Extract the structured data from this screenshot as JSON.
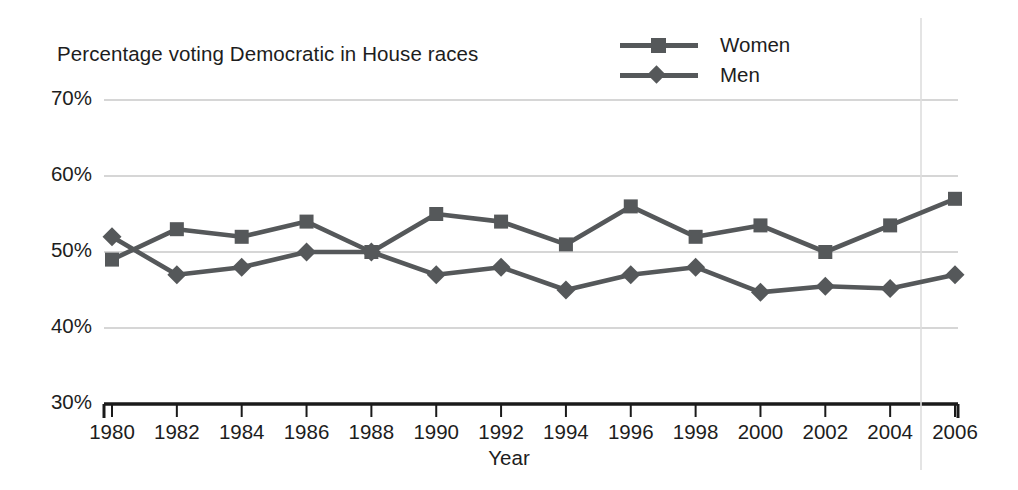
{
  "chart_data": {
    "type": "line",
    "title": "Percentage voting Democratic in House races",
    "xlabel": "Year",
    "ylabel": "",
    "categories": [
      1980,
      1982,
      1984,
      1986,
      1988,
      1990,
      1992,
      1994,
      1996,
      1998,
      2000,
      2002,
      2004,
      2006
    ],
    "x": [
      1980,
      1982,
      1984,
      1986,
      1988,
      1990,
      1992,
      1994,
      1996,
      1998,
      2000,
      2002,
      2004,
      2006
    ],
    "series": [
      {
        "name": "Women",
        "marker": "square",
        "color": "#55585a",
        "values": [
          49,
          53,
          52,
          54,
          50,
          55,
          54,
          51,
          56,
          52,
          53.5,
          50,
          53.5,
          57
        ]
      },
      {
        "name": "Men",
        "marker": "diamond",
        "color": "#55585a",
        "values": [
          52,
          47,
          48,
          50,
          50,
          47,
          48,
          45,
          47,
          48,
          44.7,
          45.5,
          45.2,
          47
        ]
      }
    ],
    "xlim": [
      1979,
      2007
    ],
    "ylim": [
      30,
      70
    ],
    "ytick_labels": [
      "70%",
      "60%",
      "50%",
      "40%",
      "30%"
    ],
    "ytick_values": [
      70,
      60,
      50,
      40,
      30
    ],
    "xtick_labels": [
      "1980",
      "1982",
      "1984",
      "1986",
      "1988",
      "1990",
      "1992",
      "1994",
      "1996",
      "1998",
      "2000",
      "2002",
      "2004",
      "2006"
    ],
    "grid": true,
    "grid_color": "#c9c9c9",
    "legend_position": "top-right",
    "legend": [
      "Women",
      "Men"
    ],
    "axis_color": "#1a1a1a",
    "background": "#ffffff"
  }
}
